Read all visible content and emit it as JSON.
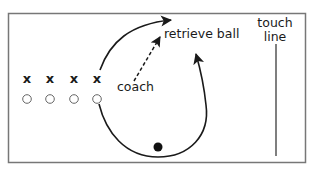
{
  "diagram": {
    "labels": {
      "coach": "coach",
      "retrieve_ball": "retrieve ball",
      "touch_line_1": "touch",
      "touch_line_2": "line"
    },
    "attackers": [
      "x",
      "x",
      "x",
      "x"
    ],
    "defenders_count": 4,
    "elements": {
      "field_border": "field-boundary",
      "touch_line": "touch-line",
      "ball": "ball",
      "coach_pass_arrow": "dashed-arrow",
      "player_run_arrow": "curved-arrow",
      "retrieve_loop_arrow": "curved-arrow"
    },
    "colors": {
      "ink": "#1a1a1a",
      "border": "#777777",
      "background": "#ffffff"
    }
  }
}
